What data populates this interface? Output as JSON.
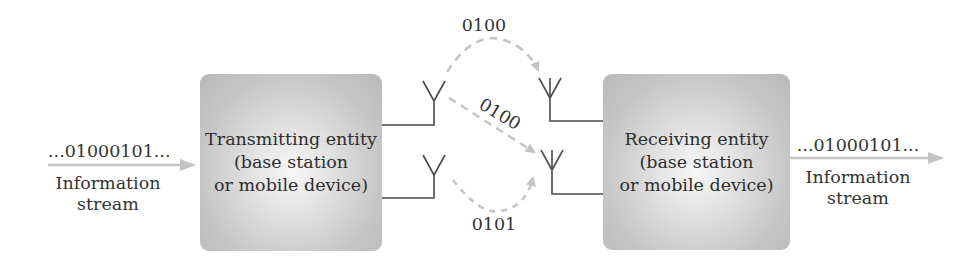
{
  "transmitter": {
    "lines": [
      "Transmitting entity",
      "(base station",
      "or mobile device)"
    ]
  },
  "receiver": {
    "lines": [
      "Receiving entity",
      "(base station",
      "or mobile device)"
    ]
  },
  "input_stream": {
    "bits": "...01000101...",
    "caption_line1": "Information",
    "caption_line2": "stream"
  },
  "output_stream": {
    "bits": "...01000101...",
    "caption_line1": "Information",
    "caption_line2": "stream"
  },
  "paths": {
    "top_arc_label": "0100",
    "diagonal_label": "0100",
    "bottom_arc_label": "0101"
  },
  "colors": {
    "arrow": "#c4c4c4",
    "line": "#4a4a4a",
    "box_edge": "#b9b9b9"
  }
}
